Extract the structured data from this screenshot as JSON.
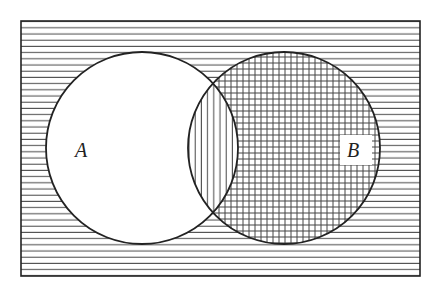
{
  "diagram": {
    "type": "venn",
    "universe": {
      "x": 21,
      "y": 21,
      "width": 399,
      "height": 255,
      "shading": "horizontal-lines"
    },
    "sets": [
      {
        "label": "A",
        "cx": 142,
        "cy": 148,
        "r": 96,
        "shading": "none"
      },
      {
        "label": "B",
        "cx": 284,
        "cy": 148,
        "r": 96,
        "shading": "crosshatch"
      }
    ],
    "intersection": {
      "shading": "vertical-lines"
    },
    "colors": {
      "line": "#222222",
      "hatch": "#555555",
      "background": "#ffffff"
    }
  }
}
